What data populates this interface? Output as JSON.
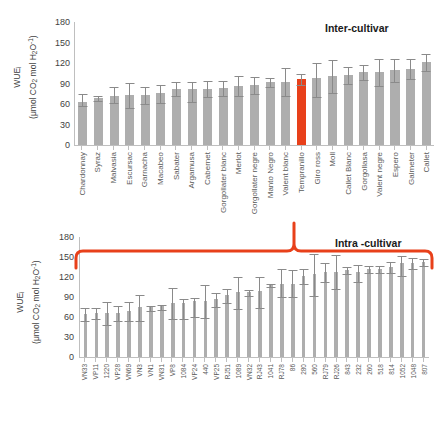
{
  "figure": {
    "background": "#ffffff",
    "bar_color": "#aeaeae",
    "highlight_color": "#e8401a",
    "error_color": "#8a8a8a",
    "axis_color": "#bfbfbf",
    "brace_color": "#e8401a"
  },
  "chart_data": [
    {
      "type": "bar",
      "id": "inter-cultivar",
      "title": "Inter-cultivar",
      "xlabel": "",
      "ylabel": "WUEi (μmol CO2 mol H2O-1)",
      "ylabel_line1": "WUE",
      "ylabel_line1_sub": "i",
      "ylabel_line2_pre": "(μmol CO",
      "ylabel_line2_sub1": "2",
      "ylabel_line2_mid": " mol H",
      "ylabel_line2_sub2": "2",
      "ylabel_line2_post": "O",
      "ylabel_line2_sup": "-1",
      "ylabel_line2_end": ")",
      "ylim": [
        0,
        180
      ],
      "yticks": [
        180,
        150,
        120,
        90,
        60,
        30,
        0
      ],
      "grid": false,
      "legend": "none",
      "highlight_category": "Tempranillo",
      "categories": [
        "Chardonnay",
        "Syraz",
        "Malvasia",
        "Escursac",
        "Garnacha",
        "Macabeo",
        "Sabater",
        "Argamusa",
        "Cabernet",
        "Gorgollater blanc",
        "Merlot",
        "Gorgollater negre",
        "Manto Negro",
        "Valent blanc",
        "Tempranillo",
        "Giro ross",
        "Moll",
        "Callet Blanc",
        "Gorgollasa",
        "Valent negre",
        "Espero",
        "Galmeter",
        "Callet"
      ],
      "values": [
        63,
        68,
        71,
        72,
        72,
        75,
        81,
        82,
        82,
        83,
        86,
        87,
        91,
        92,
        96,
        97,
        100,
        102,
        106,
        106,
        109,
        111,
        120
      ],
      "errors_upper": [
        12,
        5,
        14,
        20,
        13,
        14,
        12,
        11,
        13,
        11,
        15,
        13,
        7,
        21,
        9,
        23,
        25,
        13,
        12,
        21,
        17,
        15,
        13
      ],
      "errors_lower": [
        6,
        4,
        10,
        19,
        12,
        14,
        10,
        20,
        13,
        12,
        15,
        13,
        7,
        21,
        9,
        27,
        25,
        13,
        12,
        21,
        17,
        15,
        13
      ]
    },
    {
      "type": "bar",
      "id": "intra-cultivar",
      "title": "Intra -cultivar",
      "xlabel": "",
      "ylabel": "WUEi (μmol CO2 mol H2O-1)",
      "ylabel_line1": "WUE",
      "ylabel_line1_sub": "i",
      "ylabel_line2_pre": "(μmol CO",
      "ylabel_line2_sub1": "2",
      "ylabel_line2_mid": " mol H",
      "ylabel_line2_sub2": "2",
      "ylabel_line2_post": "O",
      "ylabel_line2_sup": "-1",
      "ylabel_line2_end": ")",
      "ylim": [
        0,
        180
      ],
      "yticks": [
        180,
        150,
        120,
        90,
        60,
        30,
        0
      ],
      "grid": false,
      "legend": "none",
      "categories": [
        "VN33",
        "VP11",
        "1220",
        "VP28",
        "VN69",
        "VN3",
        "VN1",
        "VN31",
        "VP8",
        "1084",
        "VP24",
        "440",
        "VP25",
        "RJ51",
        "1089",
        "VN32",
        "RJ43",
        "1041",
        "RJ78",
        "86",
        "280",
        "560",
        "RJ79",
        "RJ26",
        "843",
        "232",
        "260",
        "518",
        "814",
        "1052",
        "1048",
        "807"
      ],
      "values": [
        64,
        65,
        65,
        65,
        68,
        74,
        75,
        76,
        80,
        81,
        83,
        84,
        86,
        92,
        96,
        96,
        98,
        107,
        109,
        109,
        121,
        124,
        126,
        127,
        130,
        127,
        131,
        131,
        134,
        140,
        140,
        142
      ],
      "errors_upper": [
        11,
        10,
        18,
        12,
        16,
        20,
        3,
        3,
        24,
        7,
        6,
        25,
        11,
        11,
        24,
        5,
        23,
        3,
        24,
        22,
        11,
        30,
        15,
        26,
        6,
        12,
        6,
        6,
        9,
        12,
        9,
        6
      ],
      "errors_lower": [
        11,
        9,
        17,
        12,
        15,
        20,
        6,
        6,
        24,
        25,
        24,
        26,
        12,
        12,
        25,
        5,
        25,
        3,
        20,
        20,
        13,
        34,
        15,
        26,
        6,
        15,
        6,
        6,
        9,
        20,
        9,
        6
      ]
    }
  ]
}
